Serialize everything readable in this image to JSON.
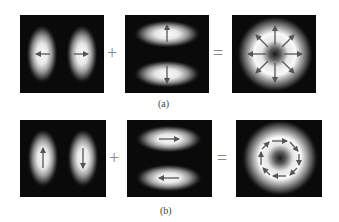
{
  "rows": [
    {
      "label": "(a)",
      "plus": "+",
      "equals": "=",
      "panels": [
        {
          "mode": "vertical-lobes",
          "arrows": "horizontal-outward"
        },
        {
          "mode": "horizontal-lobes",
          "arrows": "vertical-outward"
        },
        {
          "mode": "donut",
          "arrows": "radial-outward",
          "polarization": "radial"
        }
      ]
    },
    {
      "label": "(b)",
      "plus": "+",
      "equals": "=",
      "panels": [
        {
          "mode": "vertical-lobes",
          "arrows": "up-left-down-right"
        },
        {
          "mode": "horizontal-lobes",
          "arrows": "right-top-left-bottom"
        },
        {
          "mode": "donut",
          "arrows": "circular-clockwise",
          "polarization": "azimuthal"
        }
      ]
    }
  ],
  "colors": {
    "background": "#0a0a0a",
    "glow": "#ffffff",
    "arrow": "#555555",
    "text": "#444444"
  }
}
